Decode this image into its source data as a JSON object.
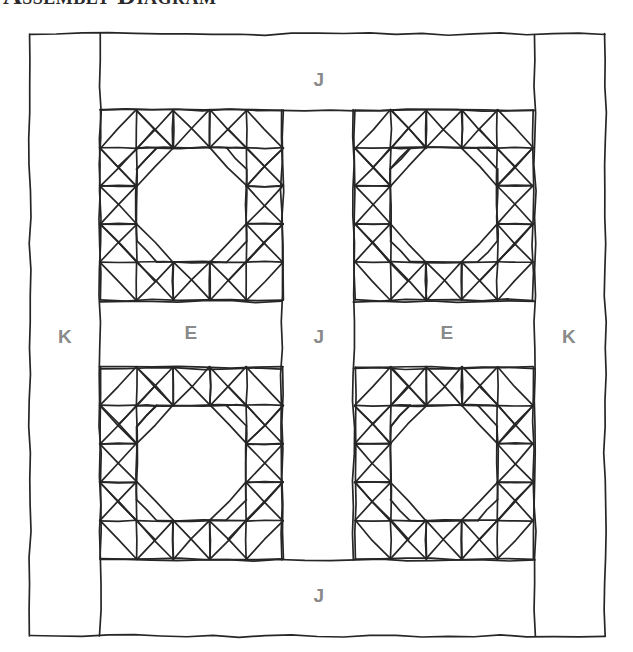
{
  "title": "Assembly Diagram",
  "colors": {
    "ink": "#262626",
    "label": "#8a8a8a",
    "background": "#ffffff"
  },
  "diagram": {
    "kind": "quilt-assembly-diagram",
    "blocks": {
      "rows": 2,
      "cols": 2,
      "count": 4,
      "grid_units": 5
    },
    "labels": [
      {
        "id": "border-left-k",
        "text": "K",
        "x": 65,
        "y": 338
      },
      {
        "id": "sashing-left-e",
        "text": "E",
        "x": 191,
        "y": 334
      },
      {
        "id": "sashing-center-j",
        "text": "J",
        "x": 319,
        "y": 338
      },
      {
        "id": "sashing-right-e",
        "text": "E",
        "x": 447,
        "y": 334
      },
      {
        "id": "border-right-k",
        "text": "K",
        "x": 569,
        "y": 338
      },
      {
        "id": "border-top-j",
        "text": "J",
        "x": 319,
        "y": 81
      },
      {
        "id": "border-bottom-j",
        "text": "J",
        "x": 319,
        "y": 597
      }
    ],
    "frame": {
      "x": 30,
      "y": 34,
      "width": 575,
      "height": 602
    },
    "border_k_width": 70,
    "border_j_height": 76,
    "sashing_j_width": 72,
    "sashing_e_height": 67,
    "block_rects": [
      {
        "x": 100,
        "y": 110,
        "w": 183,
        "h": 190
      },
      {
        "x": 355,
        "y": 110,
        "w": 178,
        "h": 190
      },
      {
        "x": 100,
        "y": 367,
        "w": 183,
        "h": 192
      },
      {
        "x": 355,
        "y": 367,
        "w": 178,
        "h": 192
      }
    ]
  }
}
